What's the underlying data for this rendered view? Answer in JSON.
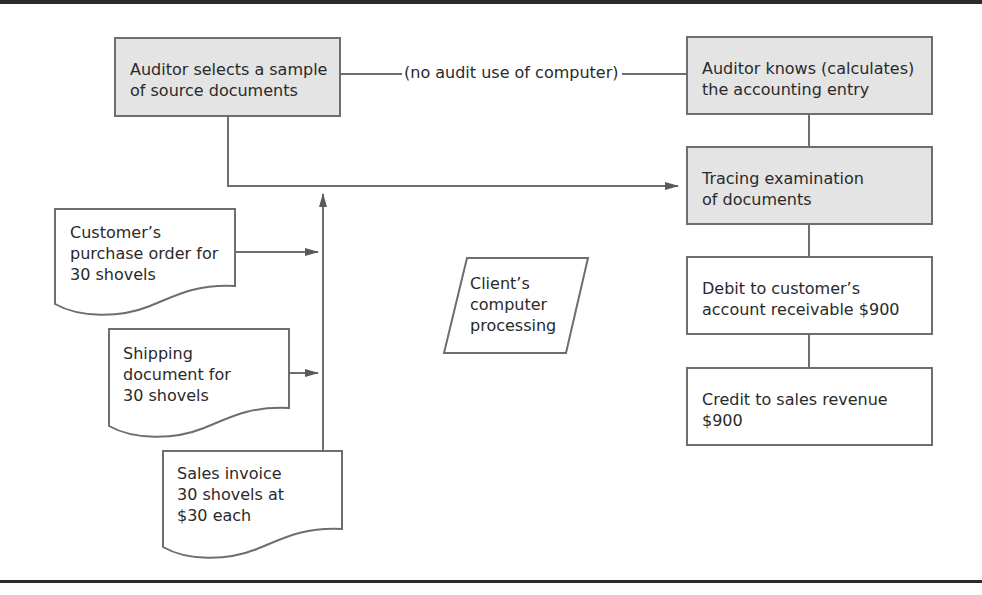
{
  "diagram": {
    "type": "flowchart",
    "title": "",
    "nodes": {
      "auditor_selects": {
        "lines": [
          "Auditor selects a sample",
          "of source documents"
        ],
        "shape": "rectangle",
        "fill": "#e4e4e4"
      },
      "auditor_knows": {
        "lines": [
          "Auditor knows (calculates)",
          "the accounting entry"
        ],
        "shape": "rectangle",
        "fill": "#e4e4e4"
      },
      "tracing": {
        "lines": [
          "Tracing examination",
          "of documents"
        ],
        "shape": "rectangle",
        "fill": "#e4e4e4"
      },
      "purchase_order": {
        "lines": [
          "Customer’s",
          "purchase order for",
          "30 shovels"
        ],
        "shape": "document"
      },
      "shipping_doc": {
        "lines": [
          "Shipping",
          "document for",
          "30 shovels"
        ],
        "shape": "document"
      },
      "sales_invoice": {
        "lines": [
          "Sales invoice",
          "30 shovels at",
          "$30 each"
        ],
        "shape": "document"
      },
      "client_processing": {
        "lines": [
          "Client’s",
          "computer",
          "processing"
        ],
        "shape": "parallelogram"
      },
      "debit": {
        "lines": [
          "Debit to customer’s",
          "account receivable $900"
        ],
        "shape": "rectangle",
        "fill": "#ffffff"
      },
      "credit": {
        "lines": [
          "Credit to sales revenue",
          "$900"
        ],
        "shape": "rectangle",
        "fill": "#ffffff"
      }
    },
    "edges": [
      {
        "from": "auditor_selects",
        "to": "auditor_knows",
        "label": "(no audit use of computer)",
        "arrow": false
      },
      {
        "from": "auditor_selects",
        "to": "tracing",
        "arrow": true
      },
      {
        "from": "purchase_order",
        "to": "source_documents_line",
        "arrow": true
      },
      {
        "from": "shipping_doc",
        "to": "source_documents_line",
        "arrow": true
      },
      {
        "from": "sales_invoice",
        "to": "auditor_selects_line",
        "arrow": true
      },
      {
        "from": "auditor_knows",
        "to": "tracing",
        "arrow": false
      },
      {
        "from": "tracing",
        "to": "debit",
        "arrow": false
      },
      {
        "from": "debit",
        "to": "credit",
        "arrow": false
      }
    ],
    "colors": {
      "stroke": "#6e6e6e",
      "gray_fill": "#e4e4e4",
      "rule": "#2b2b2b"
    }
  }
}
